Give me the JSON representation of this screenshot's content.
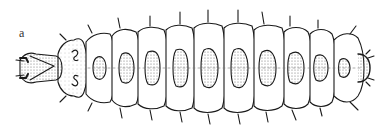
{
  "figure": {
    "panel_label": "a",
    "colors": {
      "ink": "#1a1a1a",
      "stipple": "#9a9a9a",
      "background": "#ffffff"
    }
  }
}
